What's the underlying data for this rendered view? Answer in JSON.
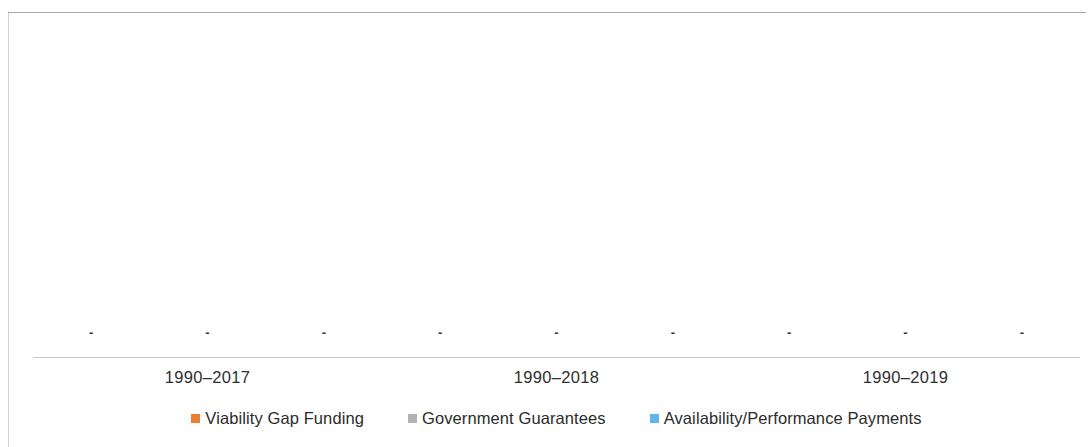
{
  "chart_data": {
    "type": "bar",
    "title": "",
    "subtitle": "",
    "xlabel": "",
    "ylabel": "",
    "grid": false,
    "legend_position": "bottom",
    "categories": [
      "1990–2017",
      "1990–2018",
      "1990–2019"
    ],
    "series": [
      {
        "name": "Viability Gap Funding",
        "color": "#ed7d31",
        "values": [
          0,
          0,
          0
        ],
        "data_labels": [
          "-",
          "-",
          "-"
        ]
      },
      {
        "name": "Government Guarantees",
        "color": "#b3b3b3",
        "values": [
          0,
          0,
          0
        ],
        "data_labels": [
          "-",
          "-",
          "-"
        ]
      },
      {
        "name": "Availability/Performance Payments",
        "color": "#5bb8e8",
        "values": [
          0,
          0,
          0
        ],
        "data_labels": [
          "-",
          "-",
          "-"
        ]
      }
    ],
    "ylim": [
      0,
      0
    ],
    "axis_line_color": "#c8c8c8",
    "frame_color": "#a9a9a9",
    "background": "#ffffff"
  }
}
